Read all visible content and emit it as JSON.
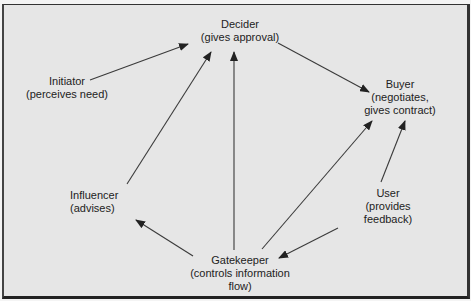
{
  "diagram": {
    "type": "buying-center-roles",
    "colors": {
      "background": "#e6e6e6",
      "border": "#333333",
      "text": "#222222",
      "arrow": "#333333"
    },
    "nodes": [
      {
        "id": "decider",
        "role": "Decider",
        "desc": "(gives approval)"
      },
      {
        "id": "initiator",
        "role": "Initiator",
        "desc": "(perceives need)"
      },
      {
        "id": "buyer",
        "role": "Buyer",
        "desc": "(negotiates,",
        "desc2": "gives contract)"
      },
      {
        "id": "influencer",
        "role": "Influencer",
        "desc": "(advises)"
      },
      {
        "id": "user",
        "role": "User",
        "desc": "(provides",
        "desc2": "feedback)"
      },
      {
        "id": "gatekeeper",
        "role": "Gatekeeper",
        "desc": "(controls information",
        "desc2": "flow)"
      }
    ],
    "edges": [
      {
        "from": "initiator",
        "to": "decider"
      },
      {
        "from": "influencer",
        "to": "decider"
      },
      {
        "from": "gatekeeper",
        "to": "decider"
      },
      {
        "from": "decider",
        "to": "buyer"
      },
      {
        "from": "gatekeeper",
        "to": "buyer"
      },
      {
        "from": "user",
        "to": "buyer"
      },
      {
        "from": "gatekeeper",
        "to": "influencer"
      },
      {
        "from": "user",
        "to": "gatekeeper"
      }
    ]
  }
}
